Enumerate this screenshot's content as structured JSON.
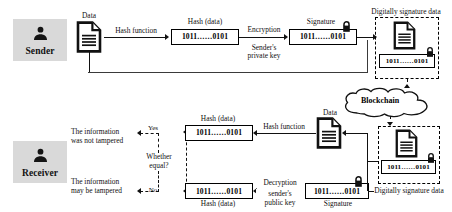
{
  "diagram": {
    "colors": {
      "actor_chip_bg": "#d9d9d9",
      "stroke": "#111111",
      "background": "#ffffff"
    }
  },
  "sender": {
    "actor_label": "Sender",
    "actor_icon": "person-icon",
    "data_doc_label": "Data",
    "data_doc_icon": "document-icon",
    "hash_function_label": "Hash function",
    "hash_box_caption": "Hash (data)",
    "hash_box_value": "1011……0101",
    "encryption_label": "Encryption",
    "encryption_key_line1": "Sender's",
    "encryption_key_line2": "private key",
    "signature_caption": "Signature",
    "signature_value": "1011……0101",
    "signature_lock_icon": "lock-icon",
    "signed_region_caption": "Digitally signature data",
    "signed_doc_icon": "document-icon",
    "signed_value": "1011……0101",
    "signed_lock_icon": "lock-icon"
  },
  "blockchain": {
    "label": "Blockchain",
    "icon": "cloud-icon"
  },
  "receiver": {
    "actor_label": "Receiver",
    "actor_icon": "person-icon",
    "result_yes_text_line1": "The information",
    "result_yes_text_line2": "was not tampered",
    "result_yes_branch": "Yes",
    "result_no_text_line1": "The information",
    "result_no_text_line2": "may be tampered",
    "result_no_branch": "No",
    "decision_line1": "Whether",
    "decision_line2": "equal?",
    "hash_top_caption": "Hash (data)",
    "hash_top_value": "1011……0101",
    "hash_function_label": "Hash function",
    "data_doc_label": "Data",
    "data_doc_icon": "document-icon",
    "hash_bottom_value": "1011……0101",
    "hash_bottom_caption": "Hash (data)",
    "decryption_label": "Decryption",
    "decryption_key_line1": "sender's",
    "decryption_key_line2": "public key",
    "signature_value": "1011……0101",
    "signature_caption": "Signature",
    "signature_lock_icon": "lock-icon",
    "signed_region_caption": "Digitally signature data",
    "signed_doc_icon": "document-icon",
    "signed_value": "1011……0101",
    "signed_lock_icon": "lock-icon"
  }
}
